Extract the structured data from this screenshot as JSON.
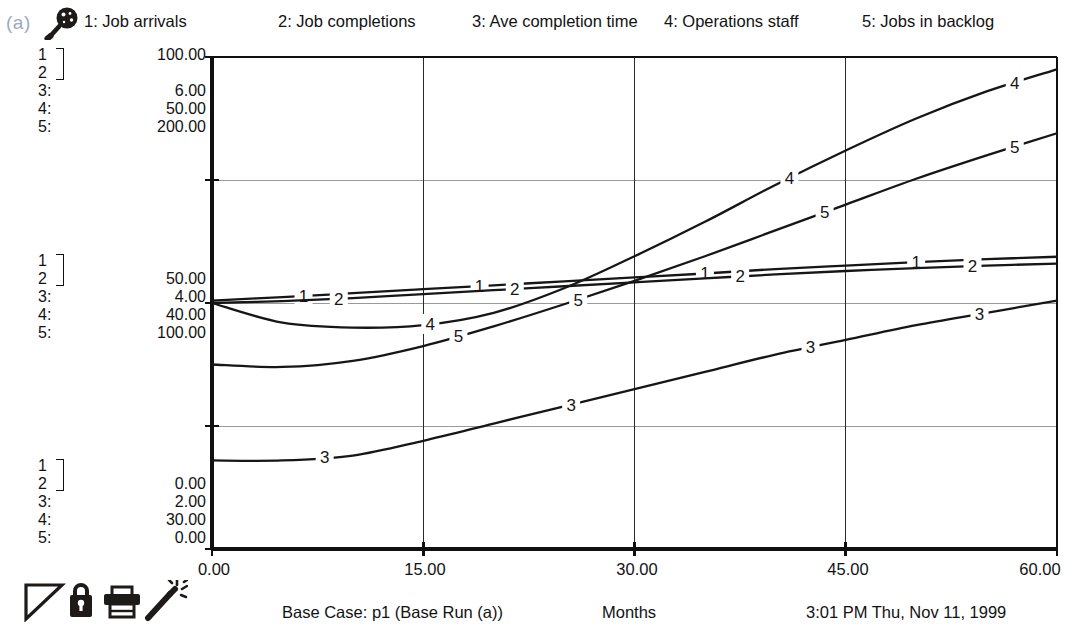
{
  "panel": {
    "label": "(a)"
  },
  "icons": {
    "magnifier": "magnifier-icon",
    "toolbar": [
      "triangle-tool-icon",
      "lock-icon",
      "printer-icon",
      "magic-wand-icon"
    ]
  },
  "legend": {
    "items": [
      {
        "key": "1",
        "label": "1: Job arrivals"
      },
      {
        "key": "2",
        "label": "2: Job completions"
      },
      {
        "key": "3",
        "label": "3: Ave completion time"
      },
      {
        "key": "4",
        "label": "4: Operations staff"
      },
      {
        "key": "5",
        "label": "5: Jobs in backlog"
      }
    ]
  },
  "scales": {
    "top": {
      "indices": [
        "1",
        "2",
        "3:",
        "4:",
        "5:"
      ],
      "values": [
        "100.00",
        "",
        "6.00",
        "50.00",
        "200.00"
      ]
    },
    "middle": {
      "indices": [
        "1",
        "2",
        "3:",
        "4:",
        "5:"
      ],
      "values": [
        "50.00",
        "",
        "4.00",
        "40.00",
        "100.00"
      ]
    },
    "bottom": {
      "indices": [
        "1",
        "2",
        "3:",
        "4:",
        "5:"
      ],
      "values": [
        "",
        "0.00",
        "2.00",
        "30.00",
        "0.00"
      ]
    }
  },
  "footer": {
    "case": "Base Case: p1 (Base Run (a))",
    "unit": "Months",
    "time": "3:01 PM   Thu, Nov 11, 1999"
  },
  "colors": {
    "line": "#161616",
    "axis": "#101010",
    "grid": "#9a9a9a",
    "panel_label": "#9aabbd",
    "background": "#ffffff"
  },
  "chart_data": {
    "type": "line",
    "title": "",
    "xlabel": "Months",
    "ylabel": "",
    "grid": true,
    "legend_position": "top",
    "x": [
      0,
      5,
      10,
      15,
      20,
      25,
      30,
      35,
      40,
      45,
      50,
      55,
      60
    ],
    "xlim": [
      0,
      60
    ],
    "xticks": [
      "0.00",
      "15.00",
      "30.00",
      "45.00",
      "60.00"
    ],
    "xtick_values": [
      0,
      15,
      30,
      45,
      60
    ],
    "y_axis_levels": [
      {
        "position": "top",
        "labels": {
          "1": "100.00",
          "2": "100.00",
          "3": "6.00",
          "4": "50.00",
          "5": "200.00"
        }
      },
      {
        "position": "middle",
        "labels": {
          "1": "50.00",
          "2": "50.00",
          "3": "4.00",
          "4": "40.00",
          "5": "100.00"
        }
      },
      {
        "position": "bottom",
        "labels": {
          "1": "0.00",
          "2": "0.00",
          "3": "2.00",
          "4": "30.00",
          "5": "0.00"
        }
      }
    ],
    "series": [
      {
        "name": "Job arrivals",
        "key": "1",
        "ylim": [
          0,
          100
        ],
        "values": [
          50.5,
          51.2,
          52.0,
          52.8,
          53.6,
          54.4,
          55.2,
          56.0,
          56.9,
          57.6,
          58.3,
          58.9,
          59.4
        ]
      },
      {
        "name": "Job completions",
        "key": "2",
        "ylim": [
          0,
          100
        ],
        "values": [
          50.0,
          50.4,
          51.0,
          51.8,
          52.6,
          53.4,
          54.2,
          55.0,
          55.8,
          56.5,
          57.1,
          57.6,
          58.0
        ]
      },
      {
        "name": "Ave completion time",
        "key": "3",
        "ylim": [
          2,
          6
        ],
        "values": [
          2.72,
          2.72,
          2.76,
          2.88,
          3.02,
          3.16,
          3.3,
          3.44,
          3.58,
          3.7,
          3.82,
          3.92,
          4.02
        ]
      },
      {
        "name": "Operations staff",
        "key": "4",
        "ylim": [
          30,
          50
        ],
        "values": [
          40.0,
          39.2,
          39.0,
          39.1,
          39.6,
          40.6,
          41.9,
          43.3,
          44.8,
          46.2,
          47.5,
          48.6,
          49.5
        ]
      },
      {
        "name": "Jobs in backlog",
        "key": "5",
        "ylim": [
          0,
          200
        ],
        "values": [
          75.0,
          74.0,
          76.5,
          82.5,
          90.5,
          99.5,
          109.0,
          119.0,
          129.5,
          140.0,
          150.5,
          160.0,
          169.0
        ]
      }
    ],
    "series_markers": [
      {
        "key": "1",
        "x_positions": [
          6.5,
          19.0,
          35.0,
          50.0
        ]
      },
      {
        "key": "2",
        "x_positions": [
          9.0,
          21.5,
          37.5,
          54.0
        ]
      },
      {
        "key": "3",
        "x_positions": [
          8.0,
          25.5,
          42.5,
          54.5
        ]
      },
      {
        "key": "4",
        "x_positions": [
          15.5,
          41.0,
          57.0
        ]
      },
      {
        "key": "5",
        "x_positions": [
          17.5,
          26.0,
          43.5,
          57.0
        ]
      }
    ]
  }
}
